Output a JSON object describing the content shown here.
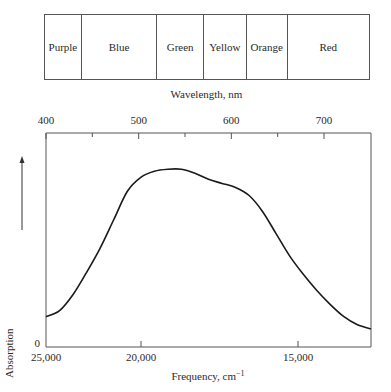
{
  "spectrum_bar": {
    "bands": [
      {
        "label": "Purple",
        "width": 37
      },
      {
        "label": "Blue",
        "width": 76
      },
      {
        "label": "Green",
        "width": 47
      },
      {
        "label": "Yellow",
        "width": 43
      },
      {
        "label": "Orange",
        "width": 41
      },
      {
        "label": "Red",
        "width": 82
      }
    ],
    "axis_label": "Wavelength, nm"
  },
  "chart_data": {
    "type": "line",
    "title": "",
    "xlabel": "Frequency, cm⁻¹",
    "ylabel": "Absorption",
    "y_ticks": [
      "0"
    ],
    "x_ticks": [
      {
        "value": 25000,
        "label": "25,000"
      },
      {
        "value": 20000,
        "label": "20,000"
      },
      {
        "value": 15000,
        "label": "15,000"
      }
    ],
    "xlim": [
      25000,
      13000
    ],
    "secondary_x": {
      "label": "Wavelength, nm",
      "ticks": [
        {
          "value": 400,
          "label": "400"
        },
        {
          "value": 500,
          "label": "500"
        },
        {
          "value": 600,
          "label": "600"
        },
        {
          "value": 700,
          "label": "700"
        }
      ],
      "minor_ticks": [
        450,
        550,
        650
      ]
    },
    "grid": false,
    "series": [
      {
        "name": "Absorption",
        "x": [
          25000,
          24500,
          24000,
          23500,
          23000,
          22500,
          22000,
          21500,
          21000,
          20500,
          20000,
          19500,
          19000,
          18500,
          18000,
          17500,
          17000,
          16500,
          16000,
          15500,
          15000,
          14500,
          14000,
          13500,
          13100
        ],
        "values": [
          0.14,
          0.17,
          0.25,
          0.36,
          0.48,
          0.62,
          0.76,
          0.83,
          0.86,
          0.87,
          0.87,
          0.85,
          0.82,
          0.8,
          0.78,
          0.74,
          0.66,
          0.55,
          0.44,
          0.35,
          0.27,
          0.2,
          0.14,
          0.1,
          0.08
        ]
      }
    ],
    "ylim": [
      0,
      1
    ]
  },
  "icons": {
    "y_arrow": "arrow-up-icon"
  }
}
